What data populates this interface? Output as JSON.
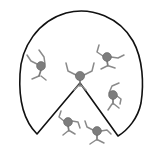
{
  "figure": {
    "canvas": {
      "width": 159,
      "height": 153,
      "background_color": "#ffffff"
    },
    "outline": {
      "name": "dome-with-v-notch",
      "stroke_color": "#111111",
      "stroke_width": 1.6,
      "fill": "none",
      "description": "Large rounded dome arc whose bottom edge is cut by an upward V notch meeting near the center figure",
      "path": "M 37 134 C 21 118 19 92 20 74 C 21 47 38 21 66 13 C 92 6 120 18 133 41 C 143 59 144 84 141 103 C 138 118 128 130 118 136 L 80 83 Z",
      "apex": {
        "x": 80,
        "y": 83
      },
      "left_tip": {
        "x": 37,
        "y": 134
      },
      "right_tip": {
        "x": 118,
        "y": 136
      },
      "leftmost_x": 20,
      "rightmost_x": 142,
      "topmost_y": 11
    },
    "figures": [
      {
        "id": "figure-center",
        "label": "center figure",
        "head": {
          "x": 80,
          "y": 76,
          "r": 4.6
        },
        "head_color": "#7d7d7d",
        "limb_color": "#8a8a8a",
        "pose": "both arms raised in V",
        "parts": {
          "torso": "M 80 80 L 80 86",
          "arm_left": "M 76 75 L 68 71 L 66 63",
          "arm_right": "M 84 75 L 92 71 L 94 63",
          "leg_left": "M 79 85 L 74 90",
          "leg_right": "M 81 85 L 86 90"
        }
      },
      {
        "id": "figure-left",
        "label": "left figure",
        "head": {
          "x": 41,
          "y": 66,
          "r": 4.4
        },
        "head_color": "#7d7d7d",
        "limb_color": "#8a8a8a",
        "pose": "arms up and out to the left",
        "parts": {
          "torso": "M 41 70 L 39 76",
          "arm_left": "M 37 64 L 31 61 L 27 55",
          "arm_right": "M 45 64 L 44 57 L 39 50",
          "leg_left": "M 39 76 L 32 79",
          "leg_right": "M 41 76 L 46 80"
        }
      },
      {
        "id": "figure-upper-right",
        "label": "upper right figure",
        "head": {
          "x": 107,
          "y": 57,
          "r": 4.4
        },
        "head_color": "#7d7d7d",
        "limb_color": "#8a8a8a",
        "pose": "arms spread wide",
        "parts": {
          "torso": "M 107 61 L 108 66",
          "arm_left": "M 103 56 L 97 52 L 99 45",
          "arm_right": "M 111 57 L 118 58 L 124 55",
          "leg_left": "M 107 66 L 101 69",
          "leg_right": "M 109 66 L 115 68"
        }
      },
      {
        "id": "figure-right",
        "label": "right middle figure",
        "head": {
          "x": 113,
          "y": 95,
          "r": 4.4
        },
        "head_color": "#7d7d7d",
        "limb_color": "#8a8a8a",
        "pose": "one arm up, one arm down",
        "parts": {
          "torso": "M 113 99 L 113 104",
          "arm_left": "M 109 93 L 112 86 L 119 83",
          "arm_right": "M 117 96 L 121 99 L 120 104",
          "leg_left": "M 112 104 L 108 110",
          "leg_right": "M 114 104 L 119 108"
        }
      },
      {
        "id": "figure-lower-left",
        "label": "lower left figure",
        "head": {
          "x": 68,
          "y": 122,
          "r": 4.4
        },
        "head_color": "#7d7d7d",
        "limb_color": "#8a8a8a",
        "pose": "arms raised in V",
        "parts": {
          "torso": "M 68 126 L 69 131",
          "arm_left": "M 64 121 L 59 117 L 61 111",
          "arm_right": "M 72 121 L 78 122 L 80 128",
          "leg_left": "M 68 131 L 63 135",
          "leg_right": "M 70 131 L 75 134"
        }
      },
      {
        "id": "figure-bottom",
        "label": "bottom figure",
        "head": {
          "x": 97,
          "y": 131,
          "r": 4.4
        },
        "head_color": "#7d7d7d",
        "limb_color": "#8a8a8a",
        "pose": "arms out sideways, legs splayed",
        "parts": {
          "torso": "M 97 135 L 97 140",
          "arm_left": "M 93 130 L 87 127 L 85 121",
          "arm_right": "M 101 131 L 107 130 L 111 134",
          "leg_left": "M 96 140 L 90 144",
          "leg_right": "M 98 140 L 104 143"
        }
      }
    ],
    "figure_count": 6
  }
}
